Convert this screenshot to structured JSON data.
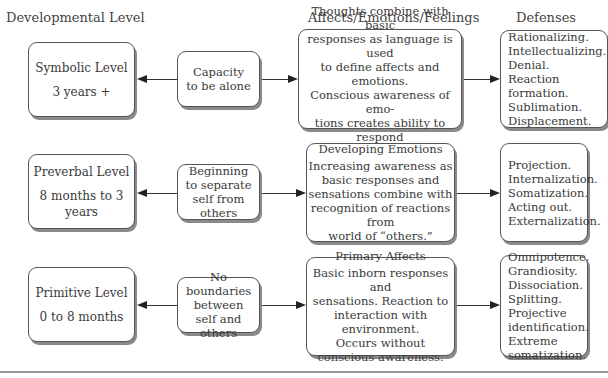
{
  "headers": {
    "developmental_level": "Developmental Level",
    "affects": "Affects/Emotions/Feelings",
    "defenses": "Defenses"
  },
  "rows": [
    {
      "level": {
        "title": "Symbolic Level",
        "age": "3 years +"
      },
      "capacity": [
        "Capacity",
        "to be alone"
      ],
      "affect": {
        "title": "Complex Feelings",
        "lines": [
          "Thoughts combine with basic",
          "responses as language is used",
          "to define affects and emotions.",
          "Conscious awareness of emo-",
          "tions creates ability to respond",
          "to emotional life of “others.”"
        ]
      },
      "defenses": [
        "Rationalizing.",
        "Intellectualizing.",
        "Denial.",
        "Reaction",
        "formation.",
        "Sublimation.",
        "Displacement."
      ]
    },
    {
      "level": {
        "title": "Preverbal Level",
        "age": "8 months to 3 years"
      },
      "capacity": [
        "Beginning",
        "to separate",
        "self from others"
      ],
      "affect": {
        "title": "Developing Emotions",
        "lines": [
          "Increasing awareness as",
          "basic responses and",
          "sensations combine with",
          "recognition of reactions from",
          "world of “others.”"
        ]
      },
      "defenses": [
        "Projection.",
        "Internalization.",
        "Somatization.",
        "Acting out.",
        "Externalization."
      ]
    },
    {
      "level": {
        "title": "Primitive Level",
        "age": "0 to 8 months"
      },
      "capacity": [
        "No boundaries",
        "between",
        "self and others"
      ],
      "affect": {
        "title": "Primary Affects",
        "lines": [
          "Basic inborn responses and",
          "sensations. Reaction to",
          "interaction with environment.",
          "Occurs without",
          "conscious awareness."
        ]
      },
      "defenses": [
        "Omnipotence.",
        "Grandiosity.",
        "Dissociation.",
        "Splitting.",
        "Projective",
        "identification.",
        "Extreme",
        "somatization."
      ]
    }
  ]
}
